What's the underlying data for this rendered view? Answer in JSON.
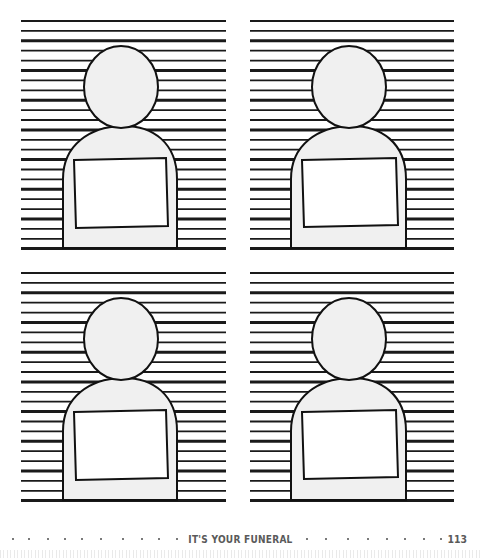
{
  "page": {
    "type": "activity-book-page",
    "footer": {
      "title": "IT'S YOUR FUNERAL",
      "page_number": "113"
    }
  },
  "panels": [
    {
      "id": "top-left",
      "x": 21,
      "y": 21,
      "width": 205,
      "height": 228
    },
    {
      "id": "top-right",
      "x": 250,
      "y": 21,
      "width": 204,
      "height": 228
    },
    {
      "id": "bottom-left",
      "x": 21,
      "y": 273,
      "width": 205,
      "height": 228
    },
    {
      "id": "bottom-right",
      "x": 250,
      "y": 273,
      "width": 204,
      "height": 228
    }
  ],
  "style": {
    "line_color": "#1a1a1a",
    "figure_fill": "#f0f0f0",
    "placard_fill": "#ffffff",
    "outline_color": "#111111",
    "footer_color": "#5a5a5a"
  }
}
